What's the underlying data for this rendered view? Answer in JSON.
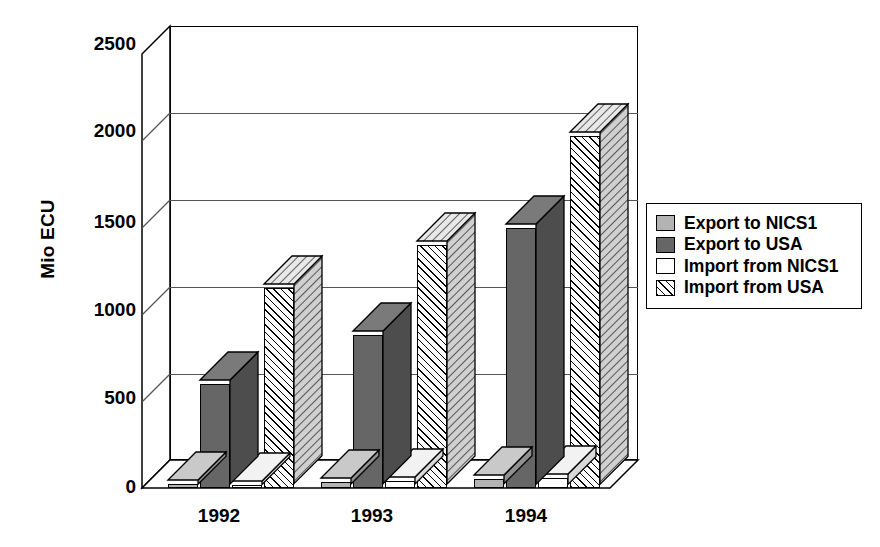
{
  "chart_data": {
    "type": "bar",
    "title": "",
    "subtitle": "",
    "xlabel": "",
    "ylabel": "Mio ECU",
    "categories": [
      "1992",
      "1993",
      "1994"
    ],
    "ylim": [
      0,
      2500
    ],
    "yticks": [
      0,
      500,
      1000,
      1500,
      2000,
      2500
    ],
    "ytick_labels": [
      "0",
      "500",
      "1000",
      "1500",
      "2000",
      "2500"
    ],
    "grid": true,
    "grid_axis": "y",
    "legend_position": "right",
    "style": "3d-grouped-bar",
    "series": [
      {
        "name": "Export to NICS1",
        "values": [
          25,
          35,
          50
        ],
        "fill": "light-gray",
        "color": "#b3b3b3"
      },
      {
        "name": "Export to USA",
        "values": [
          600,
          880,
          1500
        ],
        "fill": "dark-gray",
        "color": "#666666"
      },
      {
        "name": "Import from NICS1",
        "values": [
          20,
          40,
          60
        ],
        "fill": "white",
        "color": "#ffffff"
      },
      {
        "name": "Import from USA",
        "values": [
          1150,
          1400,
          2030
        ],
        "fill": "diagonal-hatch",
        "color": "#ffffff"
      }
    ]
  },
  "axis": {
    "y_title": "Mio ECU",
    "y_tick_labels": [
      "2500",
      "2000",
      "1500",
      "1000",
      "500",
      "0"
    ],
    "x_tick_labels": [
      "1992",
      "1993",
      "1994"
    ]
  },
  "legend": {
    "items": [
      {
        "label": "Export to NICS1",
        "swatch": "light-gray"
      },
      {
        "label": "Export to USA",
        "swatch": "dark-gray"
      },
      {
        "label": "Import from NICS1",
        "swatch": "white"
      },
      {
        "label": "Import from USA",
        "swatch": "diagonal-hatch"
      }
    ]
  }
}
